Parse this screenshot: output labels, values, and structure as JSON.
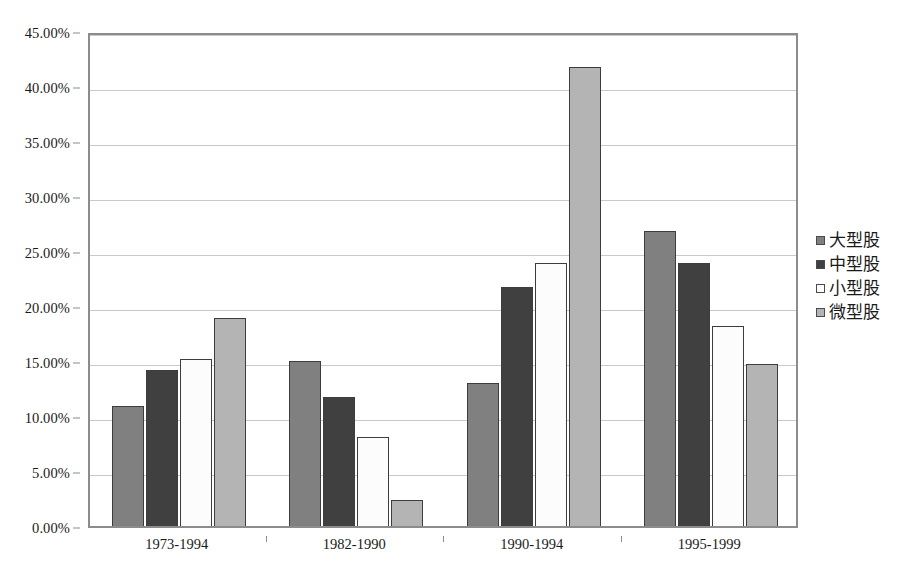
{
  "chart_data": {
    "type": "bar",
    "title": "",
    "xlabel": "",
    "ylabel": "",
    "categories": [
      "1973-1994",
      "1982-1990",
      "1990-1994",
      "1995-1999"
    ],
    "series": [
      {
        "name": "大型股",
        "color": "#808080",
        "values": [
          10.9,
          15.0,
          13.0,
          26.8
        ]
      },
      {
        "name": "中型股",
        "color": "#404040",
        "values": [
          14.2,
          11.7,
          21.7,
          23.9
        ]
      },
      {
        "name": "小型股",
        "color": "#fcfcfc",
        "values": [
          15.2,
          8.1,
          23.9,
          18.2
        ]
      },
      {
        "name": "微型股",
        "color": "#b4b4b4",
        "values": [
          18.9,
          2.4,
          41.7,
          14.7
        ]
      }
    ],
    "ylim": [
      0,
      45
    ],
    "ytick_step": 5,
    "ytick_labels": [
      "0.00%",
      "5.00%",
      "10.00%",
      "15.00%",
      "20.00%",
      "25.00%",
      "30.00%",
      "35.00%",
      "40.00%",
      "45.00%"
    ],
    "grid": true,
    "legend_position": "right",
    "plot_border_color": "#8c8c8c",
    "gridline_color": "#c9c9c9",
    "bar_outline_color": "#3d3d3d",
    "background_color": "#ffffff"
  }
}
